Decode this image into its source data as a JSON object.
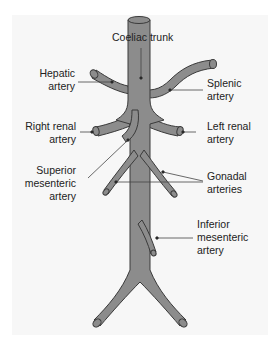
{
  "diagram": {
    "colors": {
      "vessel_fill": "#8c8c8c",
      "vessel_outline": "#3a3a3a",
      "leader_line": "#444444",
      "panel_bg": "#f7f7f7"
    },
    "labels": {
      "coeliac": {
        "line1": "Coeliac trunk"
      },
      "hepatic": {
        "line1": "Hepatic",
        "line2": "artery"
      },
      "splenic": {
        "line1": "Splenic",
        "line2": "artery"
      },
      "right_renal": {
        "line1": "Right renal",
        "line2": "artery"
      },
      "left_renal": {
        "line1": "Left renal",
        "line2": "artery"
      },
      "superior_mesenteric": {
        "line1": "Superior",
        "line2": "mesenteric",
        "line3": "artery"
      },
      "gonadal": {
        "line1": "Gonadal",
        "line2": "arteries"
      },
      "inferior_mesenteric": {
        "line1": "Inferior",
        "line2": "mesenteric",
        "line3": "artery"
      }
    }
  }
}
